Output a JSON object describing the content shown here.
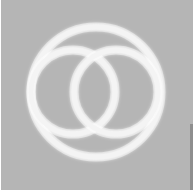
{
  "image": {
    "description": "Three glowing white rings on a gray background: one large circle enclosing two overlapping smaller circles",
    "background_color": "#b5b5b5",
    "ring_color": "#f4f4f4",
    "glow_color": "#ffffff",
    "rings": [
      {
        "name": "outer-ring",
        "cx": 96,
        "cy": 92,
        "r": 65
      },
      {
        "name": "left-ring",
        "cx": 73,
        "cy": 92,
        "r": 42
      },
      {
        "name": "right-ring",
        "cx": 116,
        "cy": 92,
        "r": 42
      }
    ],
    "stroke_width": 5
  }
}
